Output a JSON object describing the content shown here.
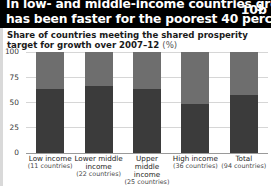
{
  "header": {
    "title_line1": "In low- and middle-income countries growth",
    "title_line2": "has been faster for the poorest 40 percent",
    "figure_number": "10b",
    "background_color": "#000000",
    "text_color": "#ffffff"
  },
  "subtitle": {
    "text": "Share of countries meeting the shared prosperity target for growth over 2007–12",
    "unit": "(%)"
  },
  "colors": {
    "bar_bottom": "#3b3b3b",
    "bar_top": "#6e6e6e",
    "gridline": "#d6d6d6",
    "axis": "#9a9a9a"
  },
  "chart_data": {
    "type": "bar",
    "title": "Share of countries meeting the shared prosperity target for growth over 2007–12 (%)",
    "xlabel": "",
    "ylabel": "",
    "ylim": [
      0,
      100
    ],
    "yticks": [
      0,
      25,
      50,
      75,
      100
    ],
    "grid": true,
    "legend": "none",
    "stacked": true,
    "categories": [
      "Low income",
      "Lower middle income",
      "Upper middle income",
      "High income",
      "Total"
    ],
    "category_counts": [
      "(11 countries)",
      "(22 countries)",
      "(25 countries)",
      "(36 countries)",
      "(94 countries)"
    ],
    "series": [
      {
        "name": "Meeting target",
        "color": "#3b3b3b",
        "values": [
          63,
          66,
          63,
          49,
          57
        ]
      },
      {
        "name": "Not meeting target",
        "color": "#6e6e6e",
        "values": [
          37,
          34,
          37,
          51,
          43
        ]
      }
    ]
  }
}
